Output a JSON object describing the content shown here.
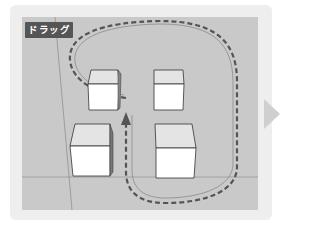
{
  "illustration": {
    "step_label": "ドラッグ",
    "description": "3D viewport with four cubes; dashed drag path encircles the right-hand cubes and ends with an upward arrow between the cubes",
    "colors": {
      "panel_bg": "#eeeeee",
      "viewport_bg": "#c9c9c9",
      "label_bg": "#555555",
      "label_text": "#ffffff",
      "drag_path": "#555555",
      "next_arrow": "#cfcfcf"
    },
    "objects": [
      {
        "name": "cube-top-left"
      },
      {
        "name": "cube-top-right"
      },
      {
        "name": "cube-bottom-left"
      },
      {
        "name": "cube-bottom-right"
      }
    ],
    "next_arrow_icon": "triangle-right"
  }
}
